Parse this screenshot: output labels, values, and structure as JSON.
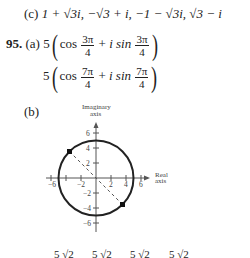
{
  "part_c": {
    "label": "(c)",
    "roots": [
      "1 + √3i,",
      "−√3 + i,",
      "−1 − √3i,",
      "√3 − i"
    ]
  },
  "problem": {
    "number": "95.",
    "part_a_label": "(a)",
    "form1": {
      "coef": "5",
      "cos": "cos",
      "num": "3π",
      "den": "4",
      "plus": "+",
      "isin": "i sin"
    },
    "form2": {
      "coef": "5",
      "cos": "cos",
      "num": "7π",
      "den": "4",
      "plus": "+",
      "isin": "i sin"
    },
    "part_b_label": "(b)"
  },
  "graph": {
    "y_axis_label_line1": "Imaginary",
    "y_axis_label_line2": "axis",
    "x_axis_label_line1": "Real",
    "x_axis_label_line2": "axis",
    "x_ticks": [
      "−6",
      "−2",
      "2",
      "4",
      "6"
    ],
    "y_ticks": [
      "6",
      "4",
      "2",
      "−2",
      "−4",
      "−6"
    ],
    "circle_radius": 5,
    "points": [
      {
        "re": -3.54,
        "im": 3.54
      },
      {
        "re": 3.54,
        "im": -3.54
      }
    ]
  },
  "bottom_fragment": {
    "items": [
      "5",
      "√2",
      "5",
      "√2",
      "5",
      "√2",
      "5",
      "√2"
    ]
  }
}
